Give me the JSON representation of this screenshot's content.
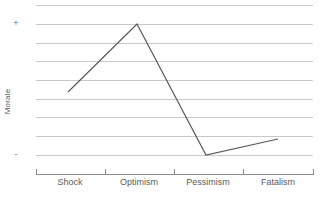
{
  "chart_data": {
    "type": "line",
    "title": "",
    "xlabel": "",
    "ylabel": "Morale",
    "categories": [
      "Shock",
      "Optimism",
      "Pessimism",
      "Fatalism"
    ],
    "values": [
      0,
      3.5,
      -3.5,
      -2.5
    ],
    "series": [
      {
        "name": "Morale",
        "values": [
          0,
          3.5,
          -3.5,
          -2.5
        ]
      }
    ],
    "ytick_labels": [
      "+",
      "-"
    ],
    "ytick_values": [
      3.5,
      -3.5
    ],
    "ylim": [
      -5,
      5
    ],
    "grid": true,
    "gridline_count": 10,
    "legend": "none",
    "line_color": "#595959",
    "grid_color": "#c9c9c9",
    "axis_color": "#8c8c8c",
    "background": "#ffffff",
    "markers": false,
    "annotations": []
  },
  "axes": {
    "y_title": "Morale",
    "y_ticks": [
      {
        "label": "+",
        "top_px": 19
      },
      {
        "label": "-",
        "top_px": 150
      }
    ],
    "x_ticks": [
      {
        "label": "Shock",
        "center_px": 70,
        "boundary_px": 36
      },
      {
        "label": "Optimism",
        "center_px": 139,
        "boundary_px": 105
      },
      {
        "label": "Pessimism",
        "center_px": 208,
        "boundary_px": 174
      },
      {
        "label": "Fatalism",
        "center_px": 278,
        "boundary_px": 243
      }
    ],
    "x_axis_end_px": 313
  },
  "grid": {
    "rows": [
      5,
      24,
      43,
      61,
      80,
      99,
      117,
      136,
      155,
      174
    ]
  },
  "plot": {
    "points": [
      {
        "category": "Shock",
        "x": 32,
        "y": 92
      },
      {
        "category": "Optimism",
        "x": 101,
        "y": 24
      },
      {
        "category": "Pessimism",
        "x": 170,
        "y": 155
      },
      {
        "category": "Fatalism",
        "x": 242,
        "y": 139
      }
    ]
  }
}
